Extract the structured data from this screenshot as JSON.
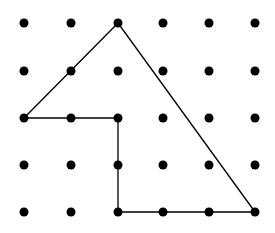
{
  "diagram": {
    "type": "dot-grid-polygon",
    "grid": {
      "columns": 6,
      "rows": 5,
      "x_positions": [
        24,
        71,
        118,
        163,
        209,
        255
      ],
      "y_positions": [
        23,
        71,
        118,
        165,
        212
      ],
      "dot_radius": 4.5,
      "dot_color": "#000000"
    },
    "polygon": {
      "vertices_grid": [
        [
          2,
          0
        ],
        [
          5,
          4
        ],
        [
          2,
          4
        ],
        [
          2,
          2
        ],
        [
          0,
          2
        ]
      ],
      "stroke_color": "#000000",
      "stroke_width": 1.3,
      "fill": "none"
    }
  }
}
